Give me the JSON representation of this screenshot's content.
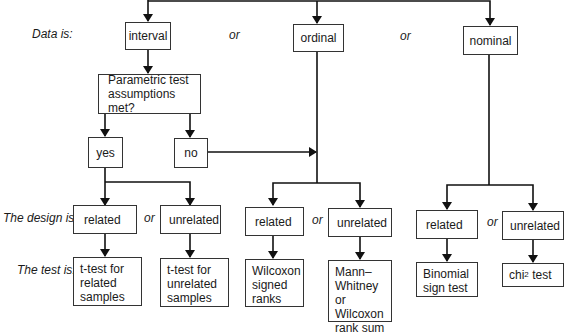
{
  "row_labels": {
    "data": "Data is:",
    "design": "The design is:",
    "test": "The test is:"
  },
  "connector": "or",
  "data_types": {
    "interval": "interval",
    "ordinal": "ordinal",
    "nominal": "nominal"
  },
  "parametric": {
    "question": "Parametric test assumptions met?",
    "yes": "yes",
    "no": "no"
  },
  "designs": {
    "interval_related": "related",
    "interval_unrelated": "unrelated",
    "ordinal_related": "related",
    "ordinal_unrelated": "unrelated",
    "nominal_related": "related",
    "nominal_unrelated": "unrelated"
  },
  "tests": {
    "interval_related": [
      "t-test for",
      "related",
      "samples"
    ],
    "interval_unrelated": [
      "t-test for",
      "unrelated",
      "samples"
    ],
    "ordinal_related": [
      "Wilcoxon",
      "signed",
      "ranks"
    ],
    "ordinal_unrelated": [
      "Mann–",
      "Whitney or",
      "Wilcoxon",
      "rank sum"
    ],
    "nominal_related": [
      "Binomial",
      "sign test"
    ],
    "nominal_unrelated": {
      "base": "chi",
      "sup": "2",
      "rest": " test"
    }
  },
  "colors": {
    "line": "#111111",
    "border": "#333333"
  }
}
